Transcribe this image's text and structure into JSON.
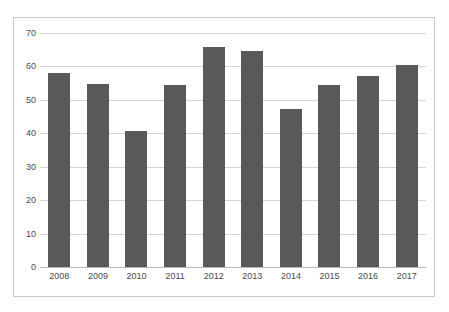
{
  "chart_data": {
    "type": "bar",
    "title": "",
    "subtitle": "",
    "xlabel": "",
    "ylabel": "",
    "categories": [
      "2008",
      "2009",
      "2010",
      "2011",
      "2012",
      "2013",
      "2014",
      "2015",
      "2016",
      "2017"
    ],
    "values": [
      58,
      54.8,
      40.8,
      54.5,
      65.8,
      64.7,
      47.3,
      54.3,
      57.2,
      60.3
    ],
    "series": [
      {
        "name": "",
        "values": [
          58,
          54.8,
          40.8,
          54.5,
          65.8,
          64.7,
          47.3,
          54.3,
          57.2,
          60.3
        ]
      }
    ],
    "ylim": [
      0,
      70
    ],
    "yticks": [
      0,
      10,
      20,
      30,
      40,
      50,
      60,
      70
    ],
    "ytick_labels": [
      "0",
      "10",
      "20",
      "30",
      "40",
      "50",
      "60",
      "70"
    ],
    "xtick_labels": [
      "2008",
      "2009",
      "2010",
      "2011",
      "2012",
      "2013",
      "2014",
      "2015",
      "2016",
      "2017"
    ],
    "grid": true,
    "grid_axis": "y",
    "legend": false,
    "legend_position": "none",
    "annotations": []
  },
  "style": {
    "bar_color": "#595959",
    "gridline_color": "#d4d4d4",
    "baseline_color": "#b8b8b8",
    "frame_color": "#c9c9c9",
    "tick_label_color": "#4a4a4a",
    "background": "#ffffff"
  }
}
